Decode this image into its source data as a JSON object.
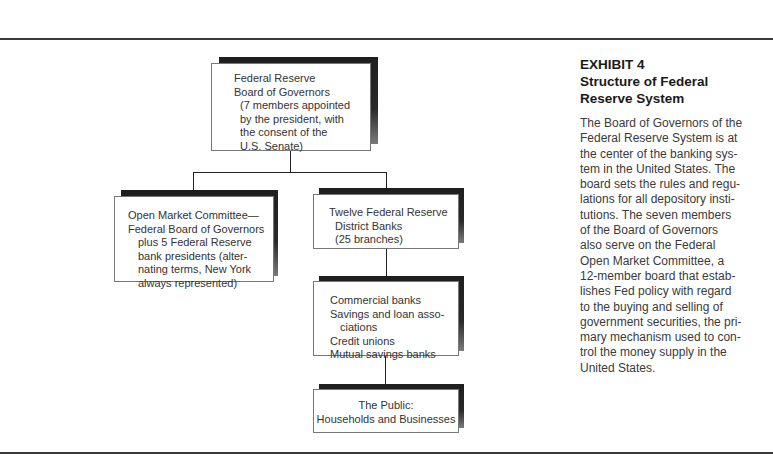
{
  "exhibit": {
    "label": "EXHIBIT 4",
    "title_lines": [
      "Structure of Federal",
      "Reserve System"
    ],
    "description_lines": [
      "The Board of Governors of the",
      "Federal Reserve System is at",
      "the center of the banking sys-",
      "tem in the United States. The",
      "board sets the rules and regu-",
      "lations for all depository insti-",
      "tutions. The seven members",
      "of the Board of Governors",
      "also serve on the Federal",
      "Open Market Committee, a",
      "12-member board that estab-",
      "lishes Fed policy with regard",
      "to the buying and selling of",
      "government securities, the pri-",
      "mary mechanism used to con-",
      "trol the money supply in the",
      "United States."
    ]
  },
  "nodes": {
    "board": {
      "lines": [
        "Federal Reserve",
        "Board of Governors",
        "(7 members appointed",
        "by the president, with",
        "the consent of the",
        "U.S. Senate)"
      ]
    },
    "fomc": {
      "lines": [
        "Open Market Committee—",
        "Federal Board of Governors",
        "plus 5 Federal Reserve",
        "bank presidents (alter-",
        "nating terms, New York",
        "always represented)"
      ]
    },
    "district_banks": {
      "lines": [
        "Twelve Federal Reserve",
        "District Banks",
        "(25 branches)"
      ]
    },
    "depository": {
      "lines": [
        "Commercial banks",
        "Savings and loan asso-",
        "ciations",
        "Credit unions",
        "Mutual savings banks"
      ]
    },
    "public": {
      "lines": [
        "The Public:",
        "Households and Businesses"
      ]
    }
  },
  "edges": [
    {
      "from": "board",
      "to": "fomc"
    },
    {
      "from": "board",
      "to": "district_banks"
    },
    {
      "from": "district_banks",
      "to": "depository"
    },
    {
      "from": "depository",
      "to": "public"
    }
  ],
  "colors": {
    "shadow": "#1e1e1e",
    "rule": "#3a3a3a",
    "text": "#333333"
  }
}
